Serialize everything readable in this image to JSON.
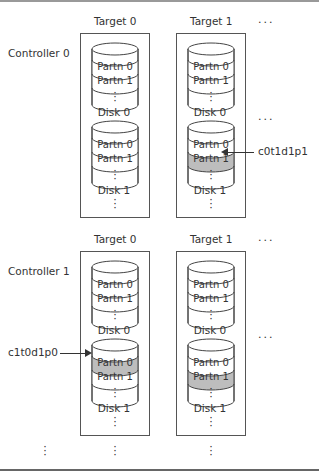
{
  "diagram": {
    "ellipsis_h": "...",
    "ellipsis_v": "⋮",
    "highlight_color": "#bdbdbd",
    "controllers": [
      {
        "label": "Controller 0",
        "targets": [
          {
            "label": "Target 0",
            "disks": [
              {
                "label": "Disk 0",
                "partitions": [
                  "Partn 0",
                  "Partn 1"
                ],
                "highlighted": []
              },
              {
                "label": "Disk 1",
                "partitions": [
                  "Partn 0",
                  "Partn 1"
                ],
                "highlighted": []
              }
            ]
          },
          {
            "label": "Target 1",
            "disks": [
              {
                "label": "Disk 0",
                "partitions": [
                  "Partn 0",
                  "Partn 1"
                ],
                "highlighted": []
              },
              {
                "label": "Disk 1",
                "partitions": [
                  "Partn 0",
                  "Partn 1"
                ],
                "highlighted": [
                  1
                ]
              }
            ]
          }
        ],
        "callout": {
          "text": "c0t1d1p1",
          "points_to": "Controller 0 / Target 1 / Disk 1 / Partn 1"
        }
      },
      {
        "label": "Controller 1",
        "targets": [
          {
            "label": "Target 0",
            "disks": [
              {
                "label": "Disk 0",
                "partitions": [
                  "Partn 0",
                  "Partn 1"
                ],
                "highlighted": []
              },
              {
                "label": "Disk 1",
                "partitions": [
                  "Partn 0",
                  "Partn 1"
                ],
                "highlighted": [
                  0
                ]
              }
            ]
          },
          {
            "label": "Target 1",
            "disks": [
              {
                "label": "Disk 0",
                "partitions": [
                  "Partn 0",
                  "Partn 1"
                ],
                "highlighted": []
              },
              {
                "label": "Disk 1",
                "partitions": [
                  "Partn 0",
                  "Partn 1"
                ],
                "highlighted": [
                  1
                ]
              }
            ]
          }
        ],
        "callout": {
          "text": "c1t0d1p0",
          "points_to": "Controller 1 / Target 0 / Disk 1 / Partn 0"
        }
      }
    ]
  }
}
